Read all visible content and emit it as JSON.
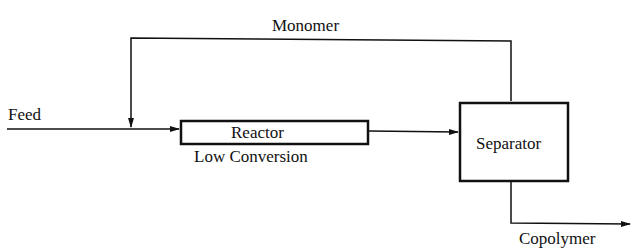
{
  "diagram": {
    "type": "process-flow",
    "labels": {
      "monomer": "Monomer",
      "feed": "Feed",
      "reactor": "Reactor",
      "reactor_note": "Low Conversion",
      "separator": "Separator",
      "copolymer": "Copolymer"
    },
    "nodes": [
      {
        "id": "reactor",
        "label": "Reactor",
        "sublabel": "Low Conversion"
      },
      {
        "id": "separator",
        "label": "Separator"
      }
    ],
    "edges": [
      {
        "from": "Feed",
        "to": "reactor"
      },
      {
        "from": "reactor",
        "to": "separator"
      },
      {
        "from": "separator",
        "to": "reactor",
        "label": "Monomer",
        "kind": "recycle"
      },
      {
        "from": "separator",
        "to": "Copolymer"
      }
    ],
    "colors": {
      "line": "#111111",
      "background": "#ffffff"
    }
  }
}
